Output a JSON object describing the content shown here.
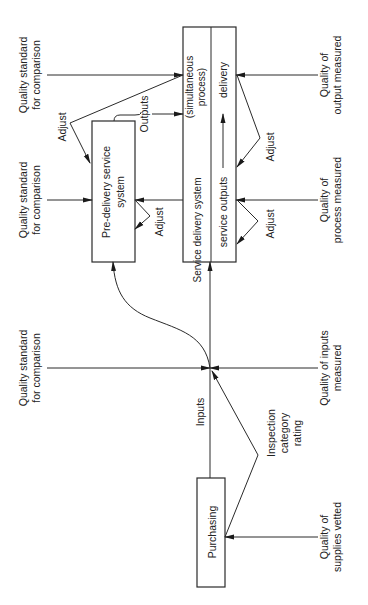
{
  "figure": {
    "orientation": "rotated 90 degrees counter-clockwise",
    "boxes": {
      "purchasing": "Purchasing",
      "pre_delivery": [
        "Pre-delivery service",
        "system"
      ],
      "service_delivery_left": "Service delivery system",
      "service_delivery_right_a": "service outputs",
      "service_delivery_right_b": "delivery",
      "simultaneous": [
        "(simultaneous",
        "process)"
      ]
    },
    "labels": {
      "outputs": "Outputs",
      "inputs": "Inputs",
      "adjust_top": "Adjust",
      "adjust_pre": "Adjust",
      "adjust_output": "Adjust",
      "adjust_process": "Adjust",
      "inspection": [
        "Inspection",
        "category",
        "rating"
      ]
    },
    "left_side": {
      "standard_top": [
        "Quality standard",
        "for comparison"
      ],
      "standard_middle": [
        "Quality standard",
        "for comparison"
      ],
      "standard_inputs": [
        "Quality standard",
        "for comparison"
      ]
    },
    "right_side": {
      "output_measured": [
        "Quality of",
        "output measured"
      ],
      "process_measured": [
        "Quality of",
        "process measured"
      ],
      "inputs_measured": [
        "Quality of inputs",
        "measured"
      ],
      "supplies_vetted": [
        "Quality of",
        "supplies vetted"
      ]
    }
  }
}
